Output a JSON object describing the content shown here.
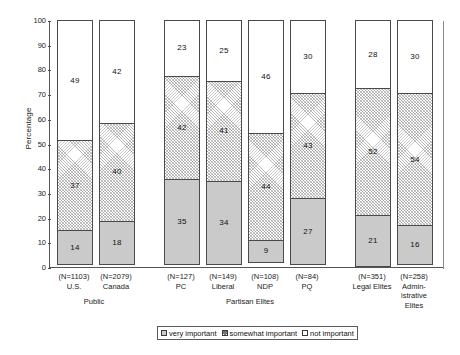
{
  "chart_data": {
    "type": "bar",
    "subtype": "stacked-percentage",
    "title": "",
    "xlabel": "",
    "ylabel": "Percentage",
    "ylim": [
      0,
      100
    ],
    "ytick_step": 10,
    "yticks": [
      "100",
      "90",
      "80",
      "70",
      "60",
      "50",
      "40",
      "30",
      "20",
      "10",
      "0"
    ],
    "grid": false,
    "legend_position": "bottom-center",
    "categories": [
      "U.S.",
      "Canada",
      "PC",
      "Liberal",
      "NDP",
      "PQ",
      "Legal Elites",
      "Admin-\nistrative\nElites"
    ],
    "sample_sizes": [
      "(N=1103)",
      "(N=2079)",
      "(N=127)",
      "(N=149)",
      "(N=108)",
      "(N=84)",
      "(N=351)",
      "(N=258)"
    ],
    "groups": [
      "Public",
      "Partisan Elites",
      ""
    ],
    "series": [
      {
        "name": "very important",
        "values": [
          14,
          18,
          35,
          34,
          9,
          27,
          21,
          16
        ]
      },
      {
        "name": "somewhat important",
        "values": [
          37,
          40,
          42,
          41,
          44,
          43,
          52,
          54
        ]
      },
      {
        "name": "not important",
        "values": [
          49,
          42,
          23,
          25,
          46,
          30,
          28,
          30
        ]
      }
    ]
  },
  "legend": {
    "items": [
      {
        "label": "very important",
        "swatch": "solid-gray"
      },
      {
        "label": "somewhat important",
        "swatch": "hatched"
      },
      {
        "label": "not important",
        "swatch": "white"
      }
    ]
  },
  "bars": [
    {
      "category": "U.S.",
      "n": "(N=1103)",
      "group": "Public",
      "very": "14",
      "somewhat": "37",
      "not": "49"
    },
    {
      "category": "Canada",
      "n": "(N=2079)",
      "group": "Public",
      "very": "18",
      "somewhat": "40",
      "not": "42"
    },
    {
      "category": "PC",
      "n": "(N=127)",
      "group": "Partisan Elites",
      "very": "35",
      "somewhat": "42",
      "not": "23"
    },
    {
      "category": "Liberal",
      "n": "(N=149)",
      "group": "Partisan Elites",
      "very": "34",
      "somewhat": "41",
      "not": "25"
    },
    {
      "category": "NDP",
      "n": "(N=108)",
      "group": "Partisan Elites",
      "very": "9",
      "somewhat": "44",
      "not": "46"
    },
    {
      "category": "PQ",
      "n": "(N=84)",
      "group": "Partisan Elites",
      "very": "27",
      "somewhat": "43",
      "not": "30"
    },
    {
      "category": "Legal Elites",
      "n": "(N=351)",
      "group": "",
      "very": "21",
      "somewhat": "52",
      "not": "28"
    },
    {
      "category": "Admin-\nistrative\nElites",
      "n": "(N=258)",
      "group": "",
      "very": "16",
      "somewhat": "54",
      "not": "30"
    }
  ],
  "axis": {
    "y_title": "Percentage",
    "y_labels": [
      "100",
      "90",
      "80",
      "70",
      "60",
      "50",
      "40",
      "30",
      "20",
      "10",
      "0"
    ]
  },
  "group_labels": [
    {
      "text": "Public"
    },
    {
      "text": "Partisan Elites"
    }
  ],
  "colors": {
    "very_important": "#cacaca",
    "somewhat_important": "#ffffff",
    "not_important": "#ffffff",
    "border": "#4a4a4a",
    "text": "#1a1a1a",
    "background": "#ffffff"
  }
}
